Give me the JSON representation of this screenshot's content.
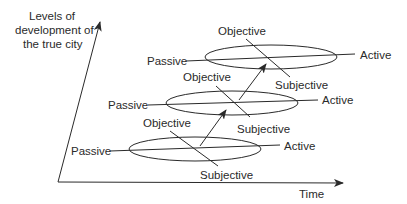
{
  "diagram": {
    "y_axis_label": [
      "Levels of",
      "development of",
      "the true city"
    ],
    "x_axis_label": "Time",
    "levels": [
      {
        "name": "level-1",
        "passive": "Passive",
        "active": "Active",
        "objective": "Objective",
        "subjective": "Subjective"
      },
      {
        "name": "level-2",
        "passive": "Passive",
        "active": "Active",
        "objective": "Objective",
        "subjective": "Subjective"
      },
      {
        "name": "level-3",
        "passive": "Passive",
        "active": "Active",
        "objective": "Objective",
        "subjective": "Subjective"
      }
    ],
    "colors": {
      "line": "#2a2a2a",
      "background": "#ffffff"
    }
  }
}
